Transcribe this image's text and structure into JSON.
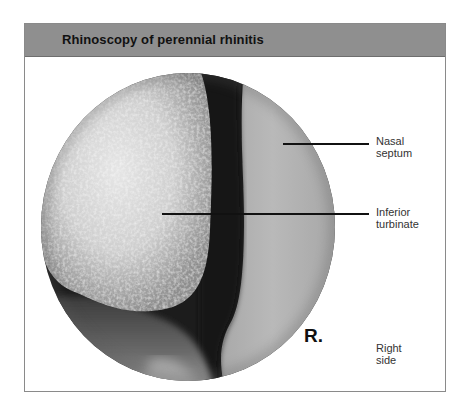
{
  "figure": {
    "title": "Rhinoscopy of perennial rhinitis",
    "header_color": "#8f8f8f",
    "image": {
      "description": "Endoscopic view of right nasal cavity (circular field)",
      "view_shape": "circle"
    },
    "labels": [
      {
        "id": "nasal-septum",
        "line1": "Nasal",
        "line2": "septum"
      },
      {
        "id": "inferior-turbinate",
        "line1": "Inferior",
        "line2": "turbinate"
      },
      {
        "id": "right-side",
        "line1": "Right",
        "line2": "side"
      }
    ],
    "side_marker": "R."
  }
}
